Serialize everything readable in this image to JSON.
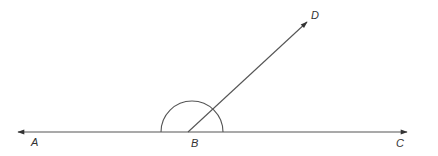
{
  "diagram": {
    "type": "geometry-angles",
    "stroke_color": "#444444",
    "points": {
      "A": {
        "label": "A",
        "x": 34,
        "y": 146
      },
      "B": {
        "label": "B",
        "x": 194,
        "y": 147
      },
      "C": {
        "label": "C",
        "x": 399,
        "y": 147
      },
      "D": {
        "label": "D",
        "x": 313,
        "y": 19
      }
    },
    "lines": [
      {
        "name": "ray-BA",
        "from": "B",
        "to": "A",
        "arrow": true
      },
      {
        "name": "ray-BC",
        "from": "B",
        "to": "C",
        "arrow": true
      },
      {
        "name": "ray-BD",
        "from": "B",
        "to": "D",
        "arrow": true
      }
    ],
    "angle_marks": [
      {
        "name": "angle-ABC-arc",
        "vertex": "B",
        "type": "semicircle"
      }
    ]
  }
}
